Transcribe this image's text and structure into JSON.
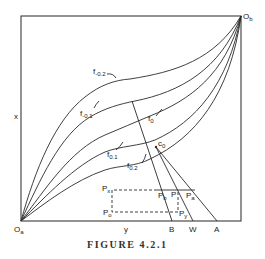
{
  "figure": {
    "caption": "FIGURE 4.2.1",
    "axis_labels": {
      "vertical": "x",
      "horizontal": "y"
    },
    "origins": {
      "bottom_left": "O",
      "bottom_left_sub": "a",
      "top_right": "O",
      "top_right_sub": "b"
    },
    "curves": [
      {
        "label": "f",
        "sub": "-0.2"
      },
      {
        "label": "f",
        "sub": "-0.1"
      },
      {
        "label": "f",
        "sub": "0"
      },
      {
        "label": "f",
        "sub": "0.1"
      },
      {
        "label": "f",
        "sub": "0.2"
      }
    ],
    "points": {
      "c0": {
        "label": "c",
        "sub": "0"
      },
      "Px": {
        "label": "P",
        "sub": "x"
      },
      "Po": {
        "label": "P",
        "sub": "o"
      },
      "Pb": {
        "label": "P",
        "sub": "b"
      },
      "P": {
        "label": "P",
        "sub": ""
      },
      "Pa": {
        "label": "P",
        "sub": "a"
      },
      "Py": {
        "label": "P",
        "sub": "y"
      }
    },
    "axis_points": [
      "B",
      "W",
      "A"
    ]
  },
  "colors": {
    "ink": "#2a2a2a",
    "background": "#ffffff"
  }
}
